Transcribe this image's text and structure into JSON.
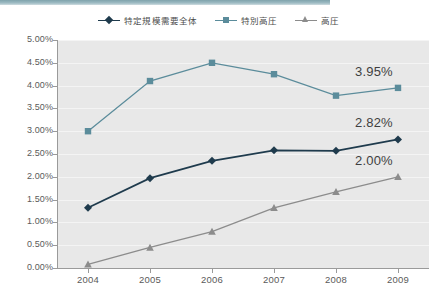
{
  "chart_data": {
    "type": "line",
    "title": "",
    "xlabel": "",
    "ylabel": "",
    "categories": [
      "2004",
      "2005",
      "2006",
      "2007",
      "2008",
      "2009"
    ],
    "ylim": [
      0,
      5
    ],
    "ytick_labels": [
      "0.00%",
      "0.50%",
      "1.00%",
      "1.50%",
      "2.00%",
      "2.50%",
      "3.00%",
      "3.50%",
      "4.00%",
      "4.50%",
      "5.00%"
    ],
    "ytick_values": [
      0,
      0.5,
      1,
      1.5,
      2,
      2.5,
      3,
      3.5,
      4,
      4.5,
      5
    ],
    "grid": true,
    "legend_position": "top-center",
    "series": [
      {
        "name": "特定規模需要全体",
        "color": "#1f3b4d",
        "marker": "diamond",
        "values": [
          1.32,
          1.97,
          2.35,
          2.58,
          2.57,
          2.82
        ],
        "end_label": "2.82%"
      },
      {
        "name": "特別高圧",
        "color": "#5b8c9b",
        "marker": "square",
        "values": [
          3.0,
          4.1,
          4.5,
          4.25,
          3.78,
          3.95
        ],
        "end_label": "3.95%"
      },
      {
        "name": "高圧",
        "color": "#8c8c8c",
        "marker": "triangle",
        "values": [
          0.08,
          0.45,
          0.8,
          1.32,
          1.67,
          2.0
        ],
        "end_label": "2.00%"
      }
    ],
    "annotations": [
      {
        "text": "3.95%",
        "series": "特別高圧",
        "category": "2009"
      },
      {
        "text": "2.82%",
        "series": "特定規模需要全体",
        "category": "2009"
      },
      {
        "text": "2.00%",
        "series": "高圧",
        "category": "2009"
      }
    ]
  },
  "colors": {
    "plot_background": "#e8e8e8",
    "gridline": "#f4f4f4",
    "axis": "#9a9a9a",
    "top_strip": "#7fa3ac"
  }
}
